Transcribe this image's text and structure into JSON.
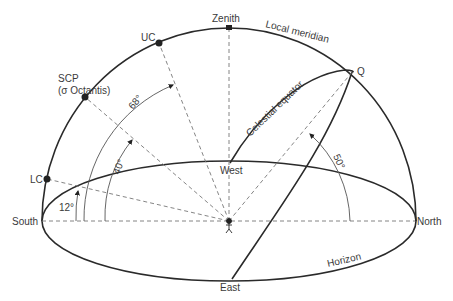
{
  "diagram": {
    "title": "",
    "points": {
      "zenith": "Zenith",
      "uc": "UC",
      "scp_line1": "SCP",
      "scp_line2": "(σ Octantis)",
      "lc": "LC",
      "q": "Q",
      "south": "South",
      "north": "North",
      "west": "West",
      "east": "East"
    },
    "curves": {
      "local_meridian": "Local meridian",
      "celestial_equator": "Celestial equator",
      "horizon": "Horizon"
    },
    "angles": {
      "lc_altitude": "12°",
      "scp_altitude": "40°",
      "uc_altitude": "68°",
      "q_altitude": "50°"
    },
    "colors": {
      "line": "#2a2a2a",
      "dashed": "#777777",
      "text": "#3a3a3a"
    }
  }
}
